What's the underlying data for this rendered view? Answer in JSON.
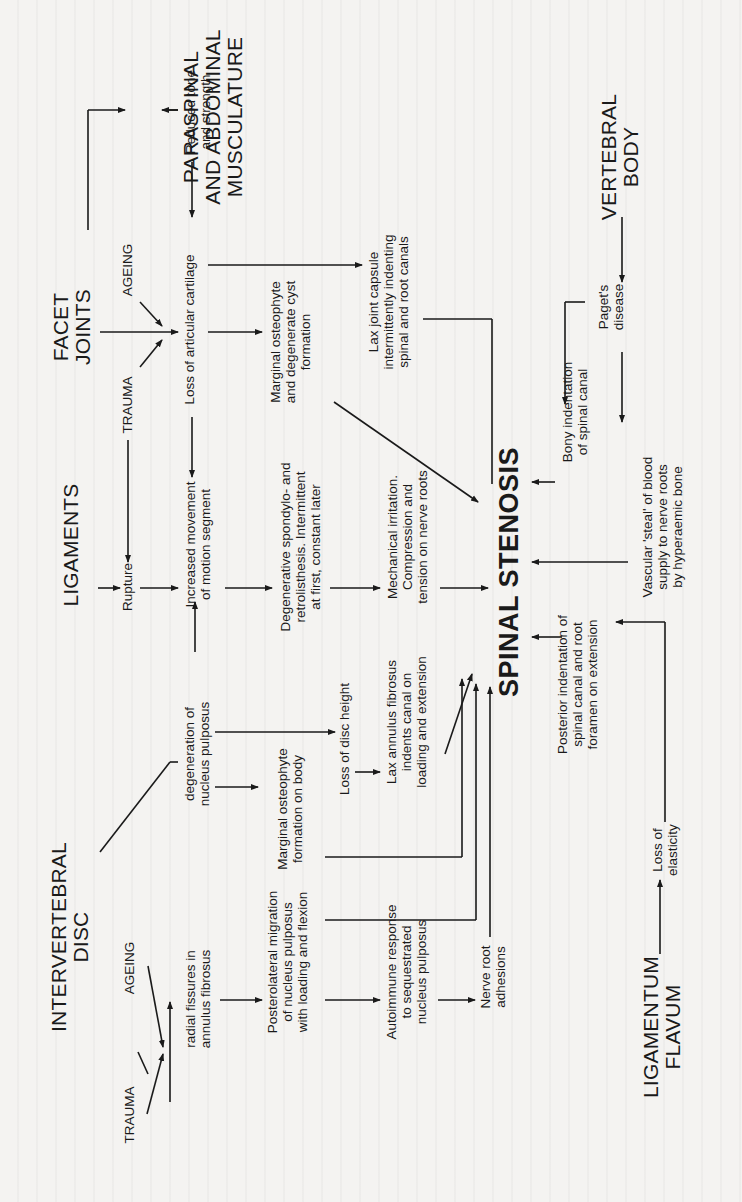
{
  "diagram": {
    "title": "SPINAL STENOSIS",
    "sources": {
      "intervertebral_disc": "INTERVERTEBRAL\nDISC",
      "ligaments": "LIGAMENTS",
      "facet_joints": "FACET\nJOINTS",
      "paraspinal": "PARASPINAL\nAND ABDOMINAL\nMUSCULATURE",
      "vertebral_body": "VERTEBRAL\nBODY",
      "ligamentum_flavum": "LIGAMENTUM\nFLAVUM"
    },
    "causes": {
      "disc_trauma": "TRAUMA",
      "disc_ageing": "AGEING",
      "facet_trauma": "TRAUMA",
      "facet_ageing": "AGEING"
    },
    "nodes": {
      "radial_fissures": "radial fissures in\nannulus fibrosus",
      "posterolateral_migration": "Posterolateral migration\nof nucleus pulposus\nwith loading and flexion",
      "autoimmune": "Autoimmune response\nto sequestrated\nnucleus pulposus",
      "nerve_root_adhesions": "Nerve root\nadhesions",
      "degeneration_np": "degeneration of\nnucleus pulposus",
      "marginal_osteophyte_body": "Marginal osteophyte\nformation on body",
      "loss_disc_height": "Loss of disc height",
      "lax_annulus": "Lax annulus fibrosus\nindents canal on\nloading and extension",
      "rupture": "Rupture",
      "increased_movement": "Increased movement\nof motion segment",
      "degenerative_spondylo": "Degenerative spondylo- and\nretrolisthesis. Intermittent\nat first, constant later",
      "mechanical_irritation": "Mechanical  irritation.\nCompression and\ntension on nerve roots",
      "loss_articular_cartilage": "Loss of articular cartilage",
      "marginal_osteophyte_cyst": "Marginal osteophyte\nand degenerate cyst\nformation",
      "lax_joint_capsule": "Lax joint capsule\nintermittently indenting\nspinal and root canals",
      "reduced_tone": "Reduced tone\nand strength",
      "pagets": "Paget's\ndisease",
      "bony_indentation": "Bony indentation\nof spinal canal",
      "vascular_steal": "Vascular 'steal' of blood\nsupply to nerve roots\nby hyperaemic bone",
      "posterior_indentation": "Posterior indentation of\nspinal canal and root\nforamen on extension",
      "loss_elasticity": "Loss of\nelasticity"
    },
    "colors": {
      "ink": "#1a1a1a",
      "paper": "#f4f3f1"
    },
    "orientation": "rotated 90° counter-clockwise"
  }
}
